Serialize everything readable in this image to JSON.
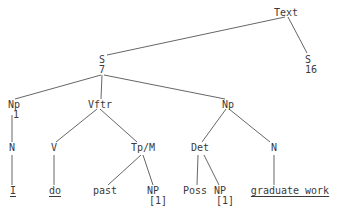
{
  "diagram": {
    "type": "syntax-tree",
    "nodes": {
      "root": {
        "label": "Text"
      },
      "s7": {
        "label": "S",
        "index": "7"
      },
      "s16": {
        "label": "S",
        "index": "16"
      },
      "np1": {
        "label": "Np",
        "index": "1"
      },
      "vftr": {
        "label": "Vftr"
      },
      "np_obj": {
        "label": "Np"
      },
      "n_subj": {
        "label": "N"
      },
      "v": {
        "label": "V"
      },
      "tpm": {
        "label": "Tp/M"
      },
      "det": {
        "label": "Det"
      },
      "n_obj": {
        "label": "N"
      },
      "leaf_i": {
        "label": "I",
        "underlined": true
      },
      "leaf_do": {
        "label": "do",
        "underlined": true
      },
      "leaf_past": {
        "label": "past"
      },
      "np_tp": {
        "label": "NP",
        "index": "[1]"
      },
      "leaf_poss": {
        "label": "Poss"
      },
      "np_det": {
        "label": "NP",
        "index": "[1]"
      },
      "leaf_gw": {
        "label": "graduate work",
        "underlined": true
      }
    },
    "edges": [
      [
        "root",
        "s7"
      ],
      [
        "root",
        "s16"
      ],
      [
        "s7",
        "np1"
      ],
      [
        "s7",
        "vftr"
      ],
      [
        "s7",
        "np_obj"
      ],
      [
        "np1",
        "n_subj"
      ],
      [
        "n_subj",
        "leaf_i"
      ],
      [
        "vftr",
        "v"
      ],
      [
        "vftr",
        "tpm"
      ],
      [
        "v",
        "leaf_do"
      ],
      [
        "tpm",
        "leaf_past"
      ],
      [
        "tpm",
        "np_tp"
      ],
      [
        "np_obj",
        "det"
      ],
      [
        "np_obj",
        "n_obj"
      ],
      [
        "det",
        "leaf_poss"
      ],
      [
        "det",
        "np_det"
      ],
      [
        "n_obj",
        "leaf_gw"
      ]
    ],
    "colors": {
      "line": "#555555",
      "text": "#3a3a3a",
      "background": "#ffffff"
    }
  }
}
